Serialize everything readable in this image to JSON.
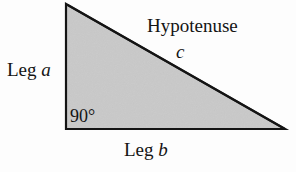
{
  "figure": {
    "name": "right-triangle-diagram",
    "background_color": "#fdfdfd"
  },
  "shape": {
    "type": "right-triangle",
    "fill_color": "#c9c9c9",
    "stroke_color": "#141414",
    "stroke_width": 2,
    "vertices": {
      "apex": [
        66,
        4
      ],
      "right_angle_corner": [
        66,
        129
      ],
      "base_right": [
        285,
        129
      ]
    }
  },
  "labels": {
    "leg_a": {
      "text": "Leg ",
      "variable": "a"
    },
    "hypotenuse": {
      "text": "Hypotenuse"
    },
    "hypotenuse_variable": {
      "variable": "c"
    },
    "right_angle": {
      "text": "90°"
    },
    "leg_b": {
      "text": "Leg ",
      "variable": "b"
    }
  }
}
